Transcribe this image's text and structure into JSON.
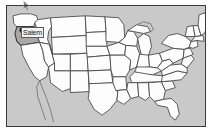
{
  "map": {
    "title": "United States map",
    "region": "United States",
    "background_color": "#c9c9c9",
    "state_fill_color": "#fdfdfd",
    "state_border_color": "#4a4a4a",
    "frame_border_color": "#3a3a3a"
  },
  "highlight": {
    "state_name": "Oregon",
    "fill_color": "#a8a8a8"
  },
  "city_marker": {
    "label": "Salem",
    "dot_color": "#2a2a2a",
    "label_background": "#f2f2f2",
    "label_text_color": "#1a1a1a"
  },
  "cursor": {
    "name": "mouse-pointer",
    "color": "#2a2a2a"
  }
}
